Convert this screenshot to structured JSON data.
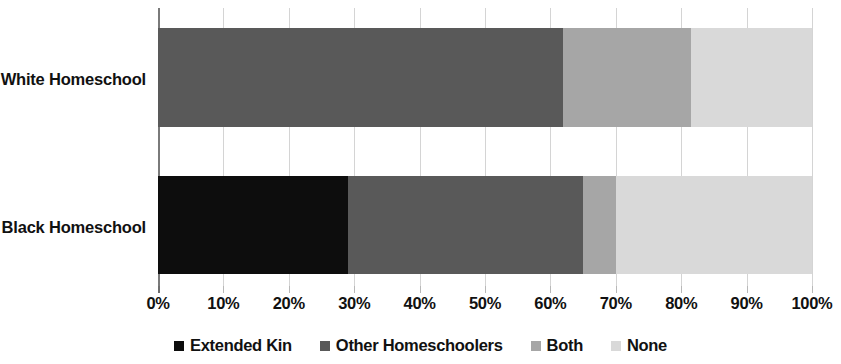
{
  "chart_data": {
    "type": "bar",
    "orientation": "horizontal",
    "stacked": true,
    "stack_mode": "percent",
    "title": "",
    "subtitle": "",
    "xlabel": "",
    "ylabel": "",
    "xlim": [
      0,
      100
    ],
    "grid": true,
    "legend_position": "bottom",
    "categories": [
      "White Homeschool",
      "Black Homeschool"
    ],
    "xticks": [
      0,
      10,
      20,
      30,
      40,
      50,
      60,
      70,
      80,
      90,
      100
    ],
    "xtick_labels": [
      "0%",
      "10%",
      "20%",
      "30%",
      "40%",
      "50%",
      "60%",
      "70%",
      "80%",
      "90%",
      "100%"
    ],
    "series": [
      {
        "name": "Extended Kin",
        "color": "#0d0d0d",
        "values": [
          0,
          29
        ]
      },
      {
        "name": "Other Homeschoolers",
        "color": "#595959",
        "values": [
          62,
          36
        ]
      },
      {
        "name": "Both",
        "color": "#a6a6a6",
        "values": [
          19.5,
          5
        ]
      },
      {
        "name": "None",
        "color": "#d9d9d9",
        "values": [
          18.5,
          30
        ]
      }
    ]
  },
  "legend": {
    "items": [
      {
        "label": "Extended Kin",
        "color": "#0d0d0d"
      },
      {
        "label": "Other Homeschoolers",
        "color": "#595959"
      },
      {
        "label": "Both",
        "color": "#a6a6a6"
      },
      {
        "label": "None",
        "color": "#d9d9d9"
      }
    ]
  },
  "axis": {
    "tick_labels": [
      "0%",
      "10%",
      "20%",
      "30%",
      "40%",
      "50%",
      "60%",
      "70%",
      "80%",
      "90%",
      "100%"
    ]
  },
  "categories": {
    "labels": [
      "White Homeschool",
      "Black Homeschool"
    ]
  }
}
